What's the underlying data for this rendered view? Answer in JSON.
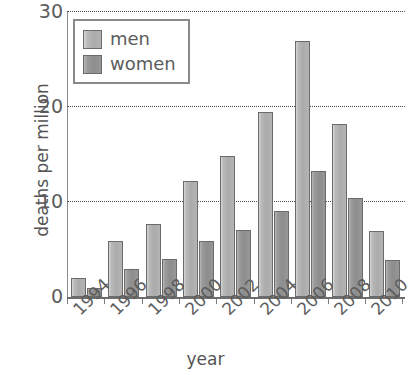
{
  "chart_data": {
    "type": "bar",
    "title": "",
    "xlabel": "year",
    "ylabel": "deaths per million",
    "categories": [
      "1994",
      "1996",
      "1998",
      "2000",
      "2002",
      "2004",
      "2006",
      "2008",
      "2010"
    ],
    "series": [
      {
        "name": "men",
        "color": "#ababab",
        "values": [
          2.0,
          5.9,
          7.7,
          12.2,
          14.8,
          19.5,
          27.0,
          18.2,
          7.0
        ]
      },
      {
        "name": "women",
        "color": "#8d8d8d",
        "values": [
          1.0,
          3.0,
          4.0,
          5.9,
          7.1,
          9.1,
          13.3,
          10.4,
          3.9
        ]
      }
    ],
    "ylim": [
      0,
      30
    ],
    "yticks": [
      0,
      10,
      20,
      30
    ],
    "ytick_labels": [
      "0",
      "10",
      "20",
      "30"
    ],
    "grid": "horizontal-dotted",
    "legend_position": "top-left-inside",
    "x_tick_label_rotation": -45
  },
  "axes": {
    "ylabel": "deaths per million",
    "xlabel": "year"
  },
  "legend": {
    "items": [
      {
        "label": "men"
      },
      {
        "label": "women"
      }
    ]
  }
}
